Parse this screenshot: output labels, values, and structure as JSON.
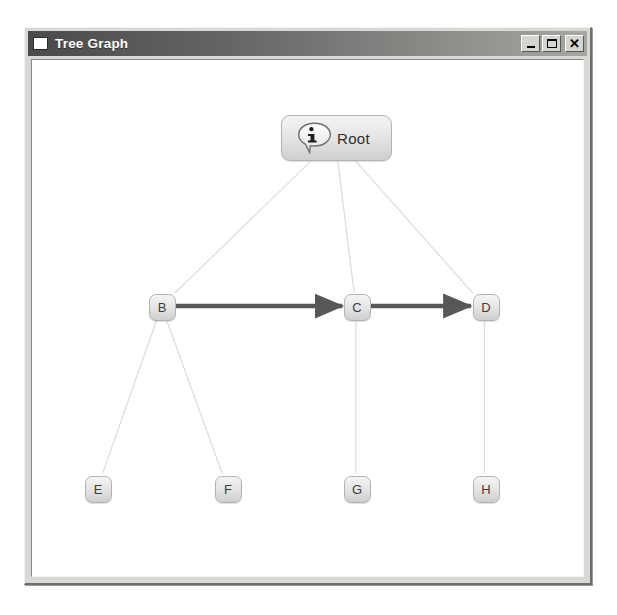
{
  "window": {
    "title": "Tree Graph",
    "app_icon": "window-square-icon",
    "controls": [
      {
        "name": "minimize-button",
        "glyph": "_",
        "label": "Minimize"
      },
      {
        "name": "maximize-button",
        "glyph": "□",
        "label": "Maximize"
      },
      {
        "name": "close-button",
        "glyph": "✕",
        "label": "Close"
      }
    ]
  },
  "colors": {
    "titlebar_start": "#4a4a4a",
    "titlebar_end": "#a6a6a2",
    "window_face": "#d8d8d4",
    "canvas_bg": "#ffffff",
    "node_fill_top": "#f4f4f4",
    "node_fill_bottom": "#cfcfcf",
    "node_border": "#b4b4b4",
    "tree_edge": "#dcdcdc",
    "arrow_edge": "#575757",
    "node_text": "#3d3d3d"
  },
  "graph": {
    "nodes": [
      {
        "id": "root",
        "label": "Root",
        "icon": "info-bubble-icon",
        "shape": "rounded-rect-wide",
        "x": 311,
        "y": 110,
        "w": 111,
        "h": 46
      },
      {
        "id": "B",
        "label": "B",
        "shape": "rounded-rect",
        "x": 137,
        "y": 279,
        "w": 27,
        "h": 27
      },
      {
        "id": "C",
        "label": "C",
        "shape": "rounded-rect",
        "x": 332,
        "y": 279,
        "w": 27,
        "h": 27
      },
      {
        "id": "D",
        "label": "D",
        "shape": "rounded-rect",
        "x": 461,
        "y": 279,
        "w": 27,
        "h": 27
      },
      {
        "id": "E",
        "label": "E",
        "shape": "rounded-rect",
        "x": 73,
        "y": 461,
        "w": 27,
        "h": 27
      },
      {
        "id": "F",
        "label": "F",
        "shape": "rounded-rect",
        "x": 203,
        "y": 461,
        "w": 27,
        "h": 27
      },
      {
        "id": "G",
        "label": "G",
        "shape": "rounded-rect",
        "x": 332,
        "y": 461,
        "w": 27,
        "h": 27
      },
      {
        "id": "H",
        "label": "H",
        "shape": "rounded-rect",
        "x": 461,
        "y": 461,
        "w": 27,
        "h": 27
      }
    ],
    "edges": [
      {
        "from": "root",
        "to": "B",
        "style": "thin-light",
        "arrow": false
      },
      {
        "from": "root",
        "to": "C",
        "style": "thin-light",
        "arrow": false
      },
      {
        "from": "root",
        "to": "D",
        "style": "thin-light",
        "arrow": false
      },
      {
        "from": "B",
        "to": "E",
        "style": "thin-light",
        "arrow": false
      },
      {
        "from": "B",
        "to": "F",
        "style": "thin-light",
        "arrow": false
      },
      {
        "from": "C",
        "to": "G",
        "style": "thin-light",
        "arrow": false
      },
      {
        "from": "D",
        "to": "H",
        "style": "thin-light",
        "arrow": false
      },
      {
        "from": "B",
        "to": "C",
        "style": "thick-dark",
        "arrow": true
      },
      {
        "from": "C",
        "to": "D",
        "style": "thick-dark",
        "arrow": true
      }
    ]
  }
}
